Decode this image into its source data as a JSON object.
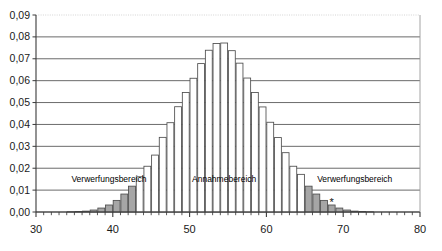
{
  "chart_data": {
    "type": "bar",
    "title": "",
    "subtitle": "",
    "xlabel": "",
    "ylabel": "",
    "xlim": [
      30,
      80
    ],
    "ylim": [
      0.0,
      0.09
    ],
    "grid": true,
    "legend_position": "none",
    "y_ticks": [
      "0,00",
      "0,01",
      "0,02",
      "0,03",
      "0,04",
      "0,05",
      "0,06",
      "0,07",
      "0,08",
      "0,09"
    ],
    "y_tick_values": [
      0.0,
      0.01,
      0.02,
      0.03,
      0.04,
      0.05,
      0.06,
      0.07,
      0.08,
      0.09
    ],
    "x_ticks": [
      "30",
      "40",
      "50",
      "60",
      "70",
      "80"
    ],
    "x_tick_values": [
      30,
      40,
      50,
      60,
      70,
      80
    ],
    "x_minor_tick_step": 1,
    "bar_fill_normal": "#ffffff",
    "bar_fill_critical": "#a6a6a6",
    "bar_stroke": "#4d4d4d",
    "categories": [
      30,
      31,
      32,
      33,
      34,
      35,
      36,
      37,
      38,
      39,
      40,
      41,
      42,
      43,
      44,
      45,
      46,
      47,
      48,
      49,
      50,
      51,
      52,
      53,
      54,
      55,
      56,
      57,
      58,
      59,
      60,
      61,
      62,
      63,
      64,
      65,
      66,
      67,
      68,
      69,
      70,
      71,
      72,
      73,
      74,
      75,
      76,
      77,
      78,
      79
    ],
    "values": [
      0.0,
      0.0,
      0.0,
      0.0,
      0.0001,
      0.0002,
      0.0004,
      0.0009,
      0.0018,
      0.0032,
      0.0053,
      0.0082,
      0.0118,
      0.0161,
      0.0209,
      0.026,
      0.0341,
      0.0408,
      0.0481,
      0.0546,
      0.0611,
      0.0678,
      0.0739,
      0.077,
      0.0772,
      0.0737,
      0.068,
      0.0612,
      0.0546,
      0.048,
      0.041,
      0.034,
      0.0271,
      0.0209,
      0.0172,
      0.0118,
      0.0082,
      0.0053,
      0.0032,
      0.0018,
      0.0009,
      0.0004,
      0.0002,
      0.0001,
      0.0,
      0.0,
      0.0,
      0.0,
      0.0,
      0.0
    ],
    "critical_left_max": 42,
    "critical_right_min": 65,
    "marker": {
      "symbol": "*",
      "x": 68,
      "y": 0.0045
    }
  },
  "annotations": {
    "left_region_label": "Verwerfungsbereich",
    "center_region_label": "Annahmebereich",
    "right_region_label": "Verwerfungsbereich"
  }
}
